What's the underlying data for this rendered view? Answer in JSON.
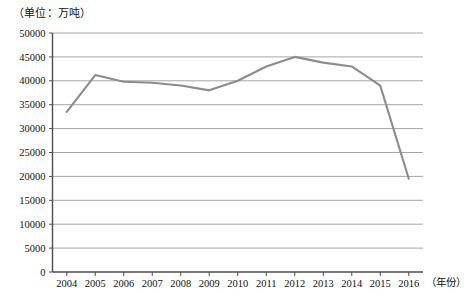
{
  "unit_label": "（单位：万吨）",
  "caption": "",
  "chart_data": {
    "type": "line",
    "title": "",
    "subtitle": "",
    "xlabel": "（年份）",
    "ylabel": "（单位：万吨）",
    "categories": [
      "2004",
      "2005",
      "2006",
      "2007",
      "2008",
      "2009",
      "2010",
      "2011",
      "2012",
      "2013",
      "2014",
      "2015",
      "2016"
    ],
    "values": [
      33500,
      41200,
      39800,
      39600,
      39000,
      38000,
      40000,
      43000,
      45000,
      43800,
      43000,
      39000,
      19500
    ],
    "series": [
      {
        "name": "产量",
        "values": [
          33500,
          41200,
          39800,
          39600,
          39000,
          38000,
          40000,
          43000,
          45000,
          43800,
          43000,
          39000,
          19500
        ]
      }
    ],
    "ylim": [
      0,
      50000
    ],
    "ytick_labels": [
      "0",
      "5000",
      "10000",
      "15000",
      "20000",
      "25000",
      "30000",
      "35000",
      "40000",
      "45000",
      "50000"
    ],
    "ytick_values": [
      0,
      5000,
      10000,
      15000,
      20000,
      25000,
      30000,
      35000,
      40000,
      45000,
      50000
    ],
    "ytick_step": 5000,
    "grid": true,
    "grid_axis": "y",
    "legend": false,
    "legend_position": "none",
    "line_color": "#8c8c8c",
    "grid_color": "#8e8e8e",
    "axis_color": "#4d4d4d",
    "markers": false,
    "annotations": []
  }
}
